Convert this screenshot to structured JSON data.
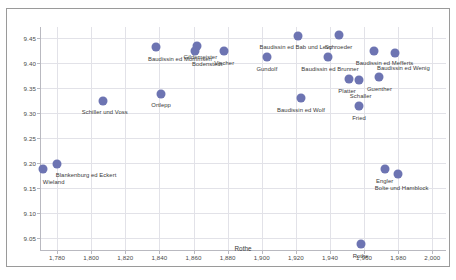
{
  "chart_data": {
    "type": "scatter",
    "title": "",
    "xlabel": "Rothe",
    "ylabel": "",
    "xlim": [
      1770,
      2008
    ],
    "ylim": [
      9.025,
      9.472
    ],
    "grid": true,
    "legend": "none",
    "marker_color": "#6d74b2",
    "xticks": [
      "1,780",
      "1,800",
      "1,820",
      "1,840",
      "1,860",
      "1,880",
      "1,900",
      "1,920",
      "1,940",
      "1,960",
      "1,980",
      "2,000"
    ],
    "xtick_values": [
      1780,
      1800,
      1820,
      1840,
      1860,
      1880,
      1900,
      1920,
      1940,
      1960,
      1980,
      2000
    ],
    "yticks": [
      "9.45",
      "9.40",
      "9.35",
      "9.30",
      "9.25",
      "9.20",
      "9.15",
      "9.10",
      "9.05"
    ],
    "ytick_values": [
      9.45,
      9.4,
      9.35,
      9.3,
      9.25,
      9.2,
      9.15,
      9.1,
      9.05
    ],
    "points": [
      {
        "label": "Wieland",
        "x": 1772,
        "y": 9.188,
        "lx": 1778,
        "ly": 9.168,
        "anchor": "center"
      },
      {
        "label": "Blankenburg ed Eckert",
        "x": 1780,
        "y": 9.198,
        "lx": 1797,
        "ly": 9.183,
        "anchor": "center"
      },
      {
        "label": "Schiller und Voss",
        "x": 1807,
        "y": 9.325,
        "lx": 1808,
        "ly": 9.308,
        "anchor": "center"
      },
      {
        "label": "Ortlepp",
        "x": 1841,
        "y": 9.338,
        "lx": 1841,
        "ly": 9.322,
        "anchor": "center"
      },
      {
        "label": "Baudissin ed Mommsen",
        "x": 1838,
        "y": 9.432,
        "lx": 1852,
        "ly": 9.414,
        "anchor": "center"
      },
      {
        "label": "Gildemeister",
        "x": 1862,
        "y": 9.435,
        "lx": 1864,
        "ly": 9.418,
        "anchor": "center"
      },
      {
        "label": "Bodenstedt",
        "x": 1861,
        "y": 9.424,
        "lx": 1868,
        "ly": 9.404,
        "anchor": "center"
      },
      {
        "label": "Vischer",
        "x": 1878,
        "y": 9.424,
        "lx": 1878,
        "ly": 9.406,
        "anchor": "center"
      },
      {
        "label": "Gundolf",
        "x": 1903,
        "y": 9.412,
        "lx": 1903,
        "ly": 9.394,
        "anchor": "center"
      },
      {
        "label": "Baudissin ed Bab und Levy",
        "x": 1921,
        "y": 9.455,
        "lx": 1920,
        "ly": 9.438,
        "anchor": "center"
      },
      {
        "label": "Schroeder",
        "x": 1945,
        "y": 9.456,
        "lx": 1945,
        "ly": 9.439,
        "anchor": "center"
      },
      {
        "label": "Baudissin ed Brunner",
        "x": 1939,
        "y": 9.412,
        "lx": 1940,
        "ly": 9.394,
        "anchor": "center"
      },
      {
        "label": "Baudissin ed Mefferts",
        "x": 1966,
        "y": 9.424,
        "lx": 1972,
        "ly": 9.406,
        "anchor": "center"
      },
      {
        "label": "Baudissin ed Wenig",
        "x": 1978,
        "y": 9.421,
        "lx": 1983,
        "ly": 9.396,
        "anchor": "center"
      },
      {
        "label": "Guenther",
        "x": 1969,
        "y": 9.372,
        "lx": 1969,
        "ly": 9.354,
        "anchor": "center"
      },
      {
        "label": "Platter",
        "x": 1951,
        "y": 9.368,
        "lx": 1950,
        "ly": 9.351,
        "anchor": "center"
      },
      {
        "label": "Schaller",
        "x": 1957,
        "y": 9.366,
        "lx": 1958,
        "ly": 9.34,
        "anchor": "center"
      },
      {
        "label": "Baudissin ed Wolf",
        "x": 1923,
        "y": 9.33,
        "lx": 1923,
        "ly": 9.313,
        "anchor": "center"
      },
      {
        "label": "Fried",
        "x": 1957,
        "y": 9.314,
        "lx": 1957,
        "ly": 9.296,
        "anchor": "center"
      },
      {
        "label": "Engler",
        "x": 1972,
        "y": 9.188,
        "lx": 1972,
        "ly": 9.171,
        "anchor": "center"
      },
      {
        "label": "Bolte und Hamblock",
        "x": 1980,
        "y": 9.178,
        "lx": 1982,
        "ly": 9.157,
        "anchor": "center"
      },
      {
        "label": "Rothe",
        "x": 1958,
        "y": 9.038,
        "lx": 1958,
        "ly": 9.022,
        "anchor": "center"
      }
    ]
  }
}
